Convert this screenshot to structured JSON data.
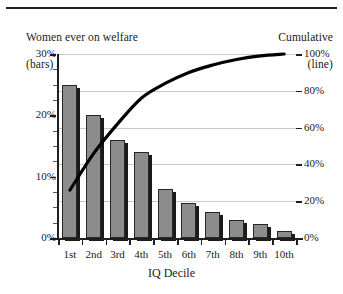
{
  "chart_data": {
    "type": "bar",
    "title": "",
    "categories": [
      "1st",
      "2nd",
      "3rd",
      "4th",
      "5th",
      "6th",
      "7th",
      "8th",
      "9th",
      "10th"
    ],
    "xlabel": "IQ Decile",
    "left_axis": {
      "label": "Women ever on welfare\n(bars)",
      "label_line1": "Women ever on welfare",
      "label_line2": "(bars)",
      "ticks": [
        "0%",
        "10%",
        "20%",
        "30%"
      ],
      "tick_values": [
        0,
        10,
        20,
        30
      ],
      "ylim": [
        0,
        30
      ]
    },
    "right_axis": {
      "label": "Cumulative\n(line)",
      "label_line1": "Cumulative",
      "label_line2": "(line)",
      "ticks": [
        "0%",
        "20%",
        "40%",
        "60%",
        "80%",
        "100%"
      ],
      "tick_values": [
        0,
        20,
        40,
        60,
        80,
        100
      ],
      "ylim": [
        0,
        100
      ]
    },
    "series": [
      {
        "name": "Women ever on welfare (bars)",
        "type": "bar",
        "axis": "left",
        "color": "#8c8c8c",
        "values": [
          25.0,
          20.0,
          16.0,
          14.0,
          8.0,
          5.7,
          4.2,
          3.0,
          2.3,
          1.1
        ]
      },
      {
        "name": "Cumulative (line)",
        "type": "line",
        "axis": "right",
        "color": "#000000",
        "values": [
          26,
          46,
          62,
          76,
          84,
          90,
          94,
          97,
          99,
          100
        ]
      }
    ],
    "grid": true,
    "legend_position": "none",
    "annotations": []
  },
  "figure": {
    "top_rule": true
  }
}
